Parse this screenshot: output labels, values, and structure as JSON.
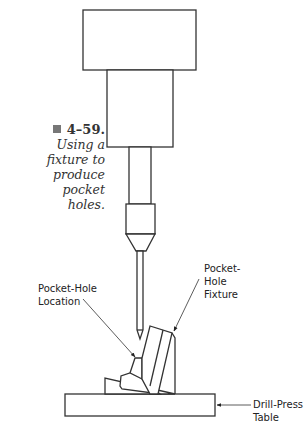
{
  "caption": {
    "figure_number": "4–59.",
    "text": "Using a fixture to produce pocket holes."
  },
  "labels": {
    "pocket_hole_location": "Pocket-Hole Location",
    "pocket_hole_fixture": "Pocket-Hole Fixture",
    "drill_press_table": "Drill-Press Table"
  },
  "colors": {
    "line": "#333333",
    "background": "#ffffff",
    "marker": "#777777"
  }
}
